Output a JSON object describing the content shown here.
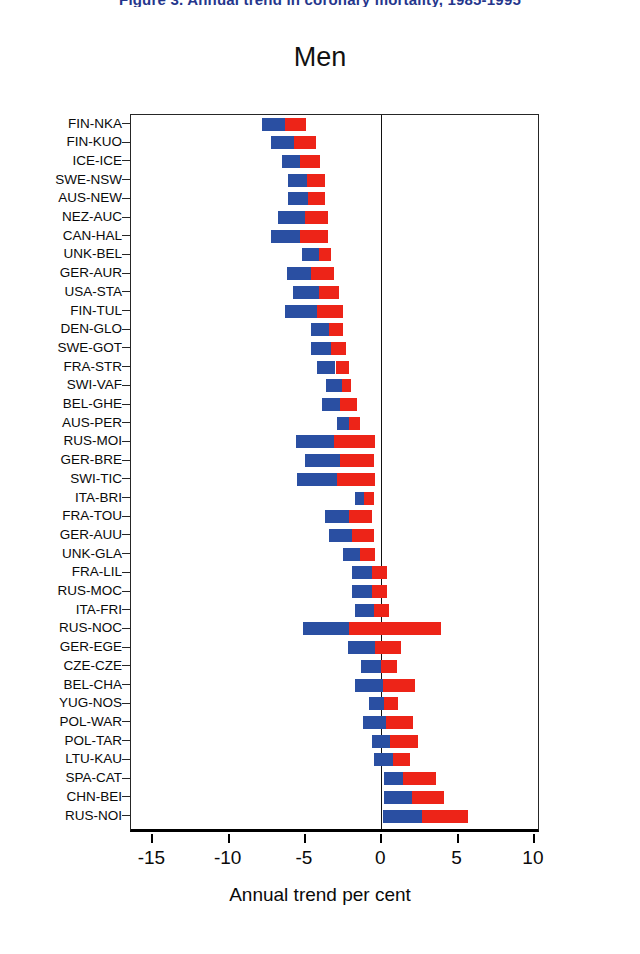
{
  "top_caption": "Figure 3. Annual trend in coronary mortality, 1985-1995",
  "chart_title": "Men",
  "axis": {
    "x_title": "Annual trend per cent",
    "x_ticks": [
      -15,
      -10,
      -5,
      0,
      5,
      10
    ],
    "x_tick_labels": [
      "-15",
      "-10",
      "-5",
      "0",
      "5",
      "10"
    ],
    "x_min": -16.4,
    "x_max": 10.4
  },
  "colors": {
    "blue": "#2a4fa2",
    "red": "#ed2418",
    "frame": "#262626",
    "caption": "#25368c"
  },
  "chart_data": {
    "type": "bar",
    "orientation": "horizontal",
    "title": "Men",
    "xlabel": "Annual trend per cent",
    "ylabel": "",
    "xlim": [
      -16.4,
      10.4
    ],
    "grid": false,
    "legend": "none",
    "note": "Each population has a floating bar with a blue segment and a red segment laid end to end; values are the start, split and end positions on the Annual trend per cent axis.",
    "categories": [
      "FIN-NKA",
      "FIN-KUO",
      "ICE-ICE",
      "SWE-NSW",
      "AUS-NEW",
      "NEZ-AUC",
      "CAN-HAL",
      "UNK-BEL",
      "GER-AUR",
      "USA-STA",
      "FIN-TUL",
      "DEN-GLO",
      "SWE-GOT",
      "FRA-STR",
      "SWI-VAF",
      "BEL-GHE",
      "AUS-PER",
      "RUS-MOI",
      "GER-BRE",
      "SWI-TIC",
      "ITA-BRI",
      "FRA-TOU",
      "GER-AUU",
      "UNK-GLA",
      "FRA-LIL",
      "RUS-MOC",
      "ITA-FRI",
      "RUS-NOC",
      "GER-EGE",
      "CZE-CZE",
      "BEL-CHA",
      "YUG-NOS",
      "POL-WAR",
      "POL-TAR",
      "LTU-KAU",
      "SPA-CAT",
      "CHN-BEI",
      "RUS-NOI"
    ],
    "series": [
      {
        "name": "blue segment start",
        "values": [
          -7.8,
          -7.2,
          -6.5,
          -6.1,
          -6.1,
          -6.8,
          -7.2,
          -5.2,
          -6.2,
          -5.8,
          -6.3,
          -4.6,
          -4.6,
          -4.2,
          -3.6,
          -3.9,
          -2.9,
          -5.6,
          -5.0,
          -5.5,
          -1.7,
          -3.7,
          -3.4,
          -2.5,
          -1.9,
          -1.9,
          -1.7,
          -5.1,
          -2.2,
          -1.3,
          -1.7,
          -0.8,
          -1.2,
          -0.6,
          -0.5,
          0.2,
          0.2,
          0.1
        ]
      },
      {
        "name": "blue/red split",
        "values": [
          -6.3,
          -5.7,
          -5.3,
          -4.9,
          -4.8,
          -5.0,
          -5.3,
          -4.1,
          -4.6,
          -4.1,
          -4.2,
          -3.4,
          -3.3,
          -3.0,
          -2.6,
          -2.7,
          -2.1,
          -3.1,
          -2.7,
          -2.9,
          -1.1,
          -2.1,
          -1.9,
          -1.4,
          -0.6,
          -0.6,
          -0.5,
          -2.1,
          -0.4,
          0.0,
          0.1,
          0.2,
          0.3,
          0.6,
          0.8,
          1.4,
          2.0,
          2.7
        ]
      },
      {
        "name": "red segment end",
        "values": [
          -4.9,
          -4.3,
          -4.0,
          -3.7,
          -3.7,
          -3.5,
          -3.5,
          -3.3,
          -3.1,
          -2.8,
          -2.5,
          -2.5,
          -2.3,
          -2.1,
          -2.0,
          -1.6,
          -1.4,
          -0.4,
          -0.5,
          -0.4,
          -0.5,
          -0.6,
          -0.5,
          -0.4,
          0.4,
          0.4,
          0.5,
          3.9,
          1.3,
          1.0,
          2.2,
          1.1,
          2.1,
          2.4,
          1.9,
          3.6,
          4.1,
          5.7
        ]
      }
    ]
  }
}
